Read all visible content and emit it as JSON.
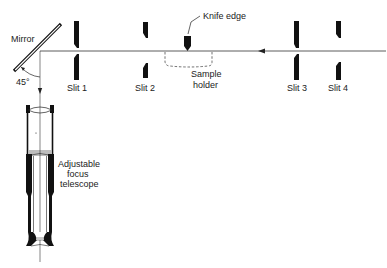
{
  "diagram": {
    "labels": {
      "mirror": "Mirror",
      "angle": "45°",
      "slit1": "Slit 1",
      "slit2": "Slit 2",
      "slit3": "Slit 3",
      "slit4": "Slit 4",
      "knife_edge": "Knife edge",
      "sample_line1": "Sample",
      "sample_line2": "holder",
      "telescope_line1": "Adjustable",
      "telescope_line2": "focus",
      "telescope_line3": "telescope"
    },
    "colors": {
      "ink": "#111111",
      "beam": "#333333",
      "background": "#ffffff"
    }
  }
}
